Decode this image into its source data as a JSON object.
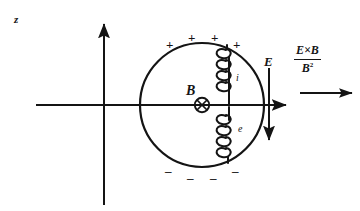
{
  "figure": {
    "type": "physics-diagram",
    "background_color": "#ffffff",
    "ink_color": "#141414"
  },
  "axes": {
    "vertical": {
      "label": "z",
      "direction": "up",
      "x": 104,
      "top": 20,
      "bottom": 205
    },
    "horizontal": {
      "label": "",
      "direction": "right",
      "y": 105,
      "left": 36,
      "right": 290
    }
  },
  "circle": {
    "center_x": 202,
    "center_y": 105,
    "radius": 62,
    "stroke_width": 2
  },
  "charges": {
    "top_sign": "+",
    "bottom_sign": "–",
    "top_positions": [
      {
        "x": 166,
        "y": 38
      },
      {
        "x": 188,
        "y": 32
      },
      {
        "x": 211,
        "y": 32
      },
      {
        "x": 233,
        "y": 38
      }
    ],
    "bottom_positions": [
      {
        "x": 166,
        "y": 167
      },
      {
        "x": 188,
        "y": 173
      },
      {
        "x": 211,
        "y": 173
      },
      {
        "x": 233,
        "y": 167
      }
    ]
  },
  "magnetic_field": {
    "label": "B",
    "symbol": "circled-cross",
    "meaning": "into-page",
    "x": 202,
    "y": 105,
    "radius": 7
  },
  "electric_field": {
    "label": "E",
    "direction": "down",
    "x": 269,
    "top": 68,
    "bottom": 143
  },
  "particles": [
    {
      "label": "i",
      "name": "ion",
      "position": "upper",
      "loops": 4,
      "path": "helix"
    },
    {
      "label": "e",
      "name": "electron",
      "position": "lower",
      "loops": 4,
      "path": "helix"
    }
  ],
  "drift_formula": {
    "numerator": "E×B",
    "denominator_base": "B",
    "denominator_exponent": "2",
    "arrow_direction": "right",
    "arrow_y": 93,
    "arrow_left": 302,
    "arrow_right": 352
  }
}
